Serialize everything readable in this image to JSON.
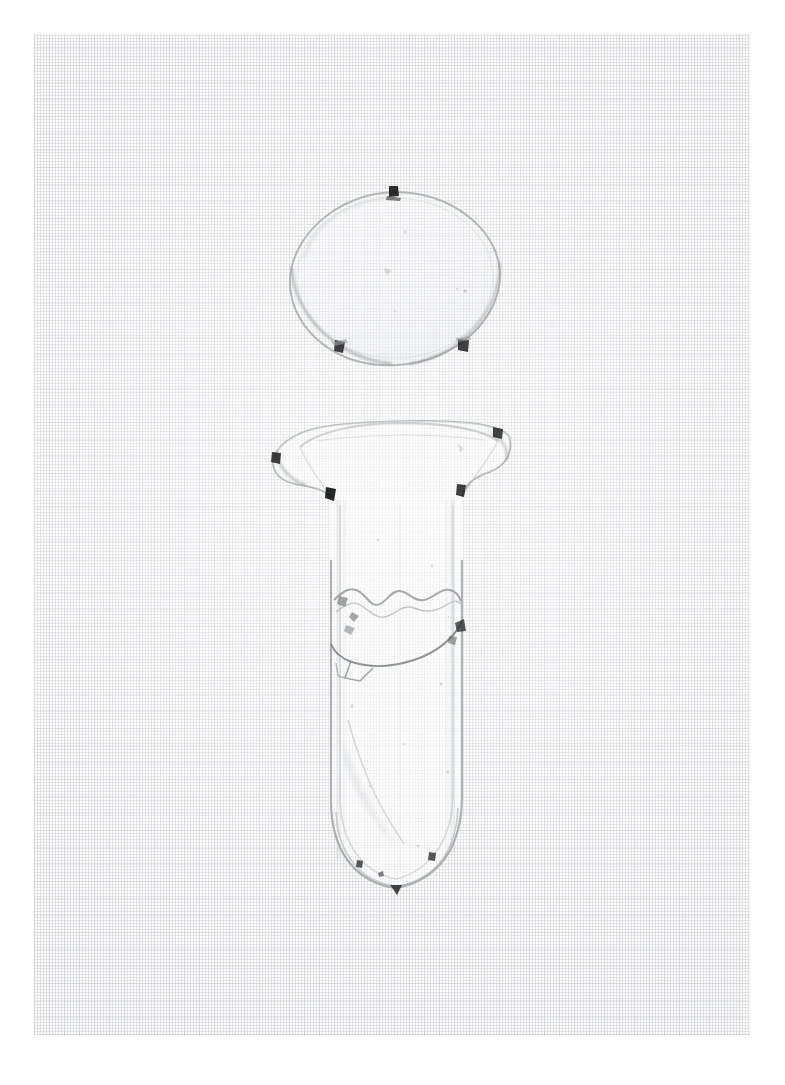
{
  "page": {
    "width": 785,
    "height": 1085,
    "background_color": "#ffffff",
    "caption": "Photographic plate of a colourless glass vessel and its separate oval lid"
  },
  "plate": {
    "name": "photographic-plate",
    "left": 34,
    "top": 34,
    "width": 716,
    "height": 1001,
    "paper_color": "#fbfbfb",
    "weave_color": "#b6babe",
    "description": "Fine woven linen / graph-cloth backing showing a regular cross-hatched grid texture"
  },
  "objects": [
    {
      "id": "lid",
      "label": "Oval glass lid",
      "shape": "ellipse",
      "center_x": 395,
      "center_y": 279,
      "radius_x": 105,
      "radius_y": 87,
      "outline_color": "#9aa0a6",
      "fill_color": "#fcfcfc",
      "clips": [
        {
          "label": "clip-top",
          "x": 394,
          "y": 192
        },
        {
          "label": "clip-bottom-left",
          "x": 340,
          "y": 349
        },
        {
          "label": "clip-bottom-right",
          "x": 463,
          "y": 347
        }
      ]
    },
    {
      "id": "vessel",
      "label": "Flanged glass tube with rounded base",
      "shape": "flanged-tube",
      "rim_left_x": 272,
      "rim_right_x": 512,
      "rim_top_y": 424,
      "flange_bottom_y": 497,
      "body_left_x": 330,
      "body_right_x": 463,
      "body_bottom_y": 888,
      "tip_x": 396,
      "tip_y": 893,
      "outline_color": "#9aa0a6",
      "fill_color": "#fcfcfc",
      "clips": [
        {
          "label": "clip-flange-left",
          "x": 330,
          "y": 492
        },
        {
          "label": "clip-flange-right",
          "x": 461,
          "y": 489
        },
        {
          "label": "clip-rim-far-left",
          "x": 277,
          "y": 458
        },
        {
          "label": "clip-rim-far-right",
          "x": 498,
          "y": 432
        },
        {
          "label": "clip-base-left",
          "x": 360,
          "y": 865
        },
        {
          "label": "clip-base-right",
          "x": 432,
          "y": 857
        },
        {
          "label": "clip-base-tip",
          "x": 396,
          "y": 890
        }
      ],
      "condition_marks": [
        {
          "label": "fracture-line-upper",
          "description": "Irregular horizontal crack crossing the body just below the neck"
        },
        {
          "label": "fracture-line-lower",
          "description": "Long diagonal crack running from the left wall down across the body"
        },
        {
          "label": "chip-left-wall",
          "description": "Small angular loss on the left wall"
        }
      ]
    }
  ],
  "colors": {
    "paper": "#fbfbfb",
    "weave": "#b6babe",
    "glass_outline": "#9aa0a6",
    "glass_shadow": "#c5c9cd",
    "mark_dark": "#1b1b1b",
    "page_white": "#ffffff"
  }
}
